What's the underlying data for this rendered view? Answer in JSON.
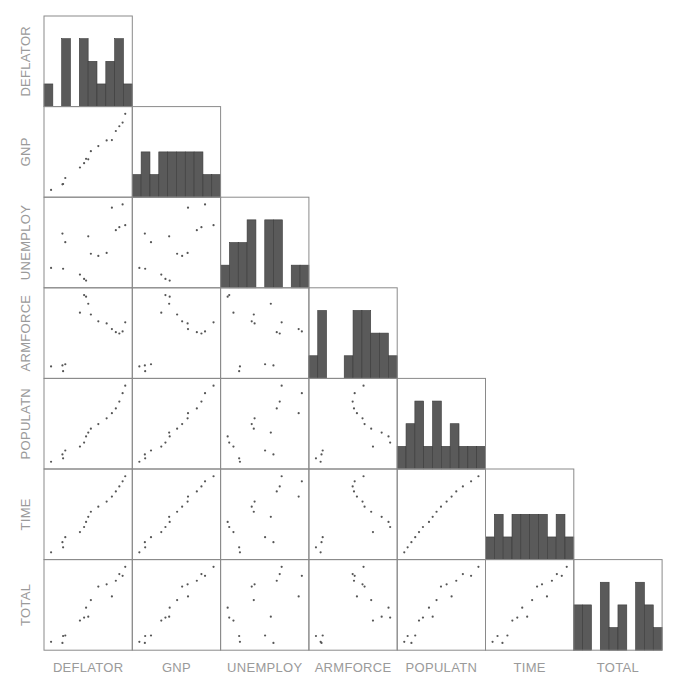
{
  "chart_data": {
    "type": "scatter_matrix",
    "title": "",
    "layout": "lower-triangle scatter plot matrix with histograms on diagonal",
    "variables": [
      "DEFLATOR",
      "GNP",
      "UNEMPLOY",
      "ARMFORCE",
      "POPULATN",
      "TIME",
      "TOTAL"
    ],
    "n_observations": 16,
    "data": {
      "DEFLATOR": [
        83,
        88.5,
        88.2,
        89.5,
        96.2,
        98.1,
        99,
        100,
        101.2,
        104.6,
        108.4,
        110.8,
        112.6,
        114.2,
        115.7,
        116.9
      ],
      "GNP": [
        234.289,
        259.426,
        258.054,
        284.599,
        328.975,
        346.999,
        365.385,
        363.112,
        397.469,
        419.18,
        442.769,
        444.546,
        482.704,
        502.601,
        518.173,
        554.894
      ],
      "UNEMPLOY": [
        235.6,
        232.5,
        368.2,
        335.1,
        209.9,
        193.2,
        187,
        357.8,
        290.4,
        282.2,
        293.6,
        468.1,
        381.3,
        393.1,
        480.6,
        400.7
      ],
      "ARMFORCE": [
        159,
        145.6,
        161.6,
        165,
        309.9,
        359.4,
        354.7,
        335,
        304.8,
        285.7,
        279.8,
        263.7,
        255.2,
        251.4,
        257.2,
        282.7
      ],
      "POPULATN": [
        107.608,
        108.632,
        109.773,
        110.929,
        112.075,
        113.27,
        115.094,
        116.219,
        117.388,
        118.734,
        120.445,
        121.95,
        123.366,
        125.368,
        127.852,
        130.081
      ],
      "TIME": [
        1947,
        1948,
        1949,
        1950,
        1951,
        1952,
        1953,
        1954,
        1955,
        1956,
        1957,
        1958,
        1959,
        1960,
        1961,
        1962
      ],
      "TOTAL": [
        60323,
        61122,
        60171,
        61187,
        63221,
        63639,
        64989,
        63761,
        66019,
        67857,
        68169,
        66513,
        68655,
        69564,
        69331,
        70551
      ]
    },
    "histograms": {
      "DEFLATOR": [
        1,
        0,
        3,
        0,
        3,
        2,
        1,
        2,
        3,
        1
      ],
      "GNP": [
        1,
        2,
        1,
        2,
        2,
        2,
        2,
        2,
        1,
        1
      ],
      "UNEMPLOY": [
        1,
        2,
        2,
        3,
        0,
        3,
        3,
        0,
        1,
        1
      ],
      "ARMFORCE": [
        1,
        3,
        0,
        0,
        1,
        3,
        3,
        2,
        2,
        1
      ],
      "POPULATN": [
        1,
        2,
        3,
        1,
        3,
        1,
        2,
        1,
        1,
        1
      ],
      "TIME": [
        1,
        2,
        1,
        2,
        2,
        2,
        2,
        1,
        2,
        1
      ],
      "TOTAL": [
        2,
        2,
        0,
        3,
        1,
        2,
        0,
        3,
        2,
        1
      ]
    },
    "hist_ymax": 4,
    "grid": false,
    "legend": null
  },
  "labels": {
    "row": [
      "DEFLATOR",
      "GNP",
      "UNEMPLOY",
      "ARMFORCE",
      "POPULATN",
      "TIME",
      "TOTAL"
    ],
    "col": [
      "DEFLATOR",
      "GNP",
      "UNEMPLOY",
      "ARMFORCE",
      "POPULATN",
      "TIME",
      "TOTAL"
    ]
  },
  "colors": {
    "bar_fill": "#5a5a5a",
    "point": "#555555",
    "border": "#8a8a8a",
    "label": "#9a9a9a"
  }
}
